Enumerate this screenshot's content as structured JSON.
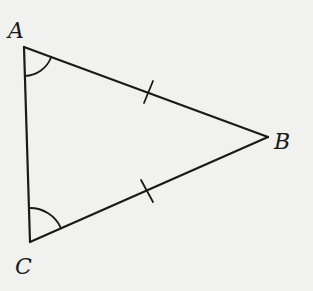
{
  "diagram": {
    "type": "isosceles-triangle",
    "colors": {
      "background": "#f1f1f0",
      "stroke": "#1a1a1a"
    },
    "vertices": [
      {
        "id": "A",
        "label": "A",
        "x": 24,
        "y": 47
      },
      {
        "id": "B",
        "label": "B",
        "x": 268,
        "y": 137
      },
      {
        "id": "C",
        "label": "C",
        "x": 30,
        "y": 242
      }
    ],
    "edges": [
      {
        "from": "A",
        "to": "B",
        "tick_marks": 1
      },
      {
        "from": "B",
        "to": "C",
        "tick_marks": 1
      },
      {
        "from": "C",
        "to": "A",
        "tick_marks": 0
      }
    ],
    "angle_marks": [
      {
        "vertex": "A",
        "arcs": 1
      },
      {
        "vertex": "C",
        "arcs": 1
      }
    ],
    "labels": {
      "A": "A",
      "B": "B",
      "C": "C"
    }
  }
}
